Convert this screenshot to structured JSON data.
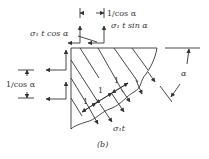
{
  "figure": {
    "caption": "(b)",
    "labels": {
      "top_dim": "1/cos α",
      "force_x": "σ₁ t cos α",
      "force_y": "σ₁ t sin α",
      "left_dim": "1/cos α",
      "unit1": "1",
      "unit2": "1",
      "unit3": "1",
      "stress": "σ₁t",
      "angle": "α"
    }
  }
}
